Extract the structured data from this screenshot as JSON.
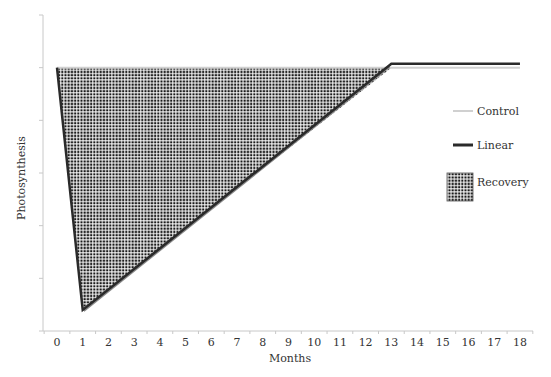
{
  "chart_data": {
    "type": "line",
    "title": "",
    "xlabel": "Months",
    "ylabel": "Photosynthesis",
    "x": [
      0,
      1,
      2,
      3,
      4,
      5,
      6,
      7,
      8,
      9,
      10,
      11,
      12,
      13,
      14,
      15,
      16,
      17,
      18
    ],
    "xlim": [
      0,
      18
    ],
    "ylim": [
      0,
      120
    ],
    "y_ticks_shown_as_labels": false,
    "y_tick_count": 7,
    "grid": false,
    "legend_position": "right",
    "series": [
      {
        "name": "Control",
        "color": "#d0d0d0",
        "x": [
          0,
          18
        ],
        "values": [
          100,
          100
        ]
      },
      {
        "name": "Linear",
        "color": "#2a2a2a",
        "x": [
          0,
          1,
          13,
          18
        ],
        "values": [
          100,
          8,
          101.5,
          101.5
        ]
      }
    ],
    "areas": [
      {
        "name": "Recovery",
        "pattern": "dot-grid",
        "description": "Region between Control and Linear from month 0 to month 13",
        "polygon": [
          [
            0,
            100
          ],
          [
            1,
            8
          ],
          [
            13,
            100
          ],
          [
            0,
            100
          ]
        ]
      }
    ],
    "legend": [
      {
        "label": "Control",
        "swatch": "line-light"
      },
      {
        "label": "Linear",
        "swatch": "line-dark"
      },
      {
        "label": "Recovery",
        "swatch": "pattern"
      }
    ]
  },
  "axis": {
    "x_tick_labels": [
      "0",
      "1",
      "2",
      "3",
      "4",
      "5",
      "6",
      "7",
      "8",
      "9",
      "10",
      "11",
      "12",
      "13",
      "14",
      "15",
      "16",
      "17",
      "18"
    ],
    "x_title": "Months",
    "y_title": "Photosynthesis"
  },
  "colors": {
    "axis": "#c8c8c8",
    "control": "#d0d0d0",
    "linear": "#2a2a2a",
    "diagonal_edge": "#8a8a8a",
    "pattern_dot": "#1a1a1a"
  }
}
